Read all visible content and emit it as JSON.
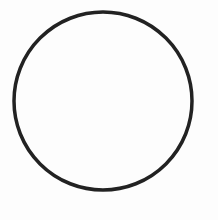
{
  "canvas": {
    "width": 218,
    "height": 220,
    "background": "#fdfdfd"
  },
  "shapes": [
    {
      "type": "circle",
      "cx": 103,
      "cy": 101,
      "r": 89,
      "stroke": "#222222",
      "stroke_width": 3.5,
      "fill": "none"
    }
  ]
}
